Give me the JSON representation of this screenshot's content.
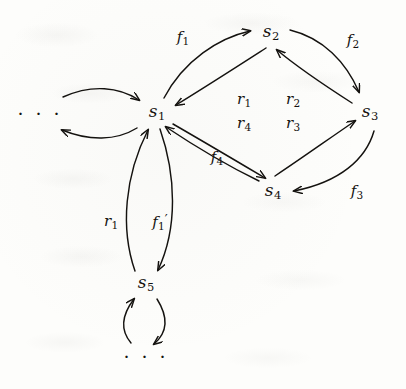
{
  "figure": {
    "kind": "state-transition-diagram",
    "background_color": "#fdfdfb",
    "ink_color": "#14120f",
    "width": 406,
    "height": 389
  },
  "nodes": [
    {
      "id": "dots_left",
      "label": "· · ·",
      "base": "",
      "sub": "",
      "x": 40,
      "y": 113,
      "type": "ellipsis"
    },
    {
      "id": "s1",
      "label": "s1",
      "base": "s",
      "sub": "1",
      "x": 157,
      "y": 113,
      "type": "state"
    },
    {
      "id": "s2",
      "label": "s2",
      "base": "s",
      "sub": "2",
      "x": 271,
      "y": 33,
      "type": "state"
    },
    {
      "id": "s3",
      "label": "s3",
      "base": "s",
      "sub": "3",
      "x": 370,
      "y": 113,
      "type": "state"
    },
    {
      "id": "s4",
      "label": "s4",
      "base": "s",
      "sub": "4",
      "x": 273,
      "y": 192,
      "type": "state"
    },
    {
      "id": "s5",
      "label": "s5",
      "base": "s",
      "sub": "5",
      "x": 146,
      "y": 284,
      "type": "state"
    },
    {
      "id": "dots_bottom",
      "label": "· · ·",
      "base": "",
      "sub": "",
      "x": 146,
      "y": 356,
      "type": "ellipsis"
    }
  ],
  "edge_labels": [
    {
      "id": "f1",
      "base": "f",
      "sub": "1",
      "prime": "",
      "x": 183,
      "y": 38,
      "from": "s1",
      "to": "s2"
    },
    {
      "id": "f2",
      "base": "f",
      "sub": "2",
      "prime": "",
      "x": 353,
      "y": 41,
      "from": "s2",
      "to": "s3"
    },
    {
      "id": "f3",
      "base": "f",
      "sub": "3",
      "prime": "",
      "x": 357,
      "y": 192,
      "from": "s3",
      "to": "s4"
    },
    {
      "id": "f4",
      "base": "f",
      "sub": "4",
      "prime": "",
      "x": 217,
      "y": 158,
      "from": "s4",
      "to": "s1"
    },
    {
      "id": "r1_center",
      "base": "r",
      "sub": "1",
      "prime": "",
      "x": 244,
      "y": 100,
      "from": "s2",
      "to": "s1"
    },
    {
      "id": "r2_center",
      "base": "r",
      "sub": "2",
      "prime": "",
      "x": 293,
      "y": 100,
      "from": "s3",
      "to": "s2"
    },
    {
      "id": "r4_center",
      "base": "r",
      "sub": "4",
      "prime": "",
      "x": 244,
      "y": 124,
      "from": "s1",
      "to": "s4"
    },
    {
      "id": "r3_center",
      "base": "r",
      "sub": "3",
      "prime": "",
      "x": 293,
      "y": 124,
      "from": "s4",
      "to": "s3"
    },
    {
      "id": "r1_lower",
      "base": "r",
      "sub": "1",
      "prime": "",
      "x": 111,
      "y": 222,
      "from": "s5",
      "to": "s1"
    },
    {
      "id": "f1_prime",
      "base": "f",
      "sub": "1",
      "prime": "′",
      "x": 160,
      "y": 222,
      "from": "s1",
      "to": "s5"
    }
  ],
  "edges": [
    {
      "id": "e_dots_to_s1",
      "from": "dots_left",
      "to": "s1",
      "label": ""
    },
    {
      "id": "e_s1_to_dots",
      "from": "s1",
      "to": "dots_left",
      "label": ""
    },
    {
      "id": "e_s1_s2",
      "from": "s1",
      "to": "s2",
      "label": "f1"
    },
    {
      "id": "e_s2_s1",
      "from": "s2",
      "to": "s1",
      "label": "r1"
    },
    {
      "id": "e_s2_s3",
      "from": "s2",
      "to": "s3",
      "label": "f2"
    },
    {
      "id": "e_s3_s2",
      "from": "s3",
      "to": "s2",
      "label": "r2"
    },
    {
      "id": "e_s3_s4",
      "from": "s3",
      "to": "s4",
      "label": "f3"
    },
    {
      "id": "e_s4_s3",
      "from": "s4",
      "to": "s3",
      "label": "r3"
    },
    {
      "id": "e_s4_s1",
      "from": "s4",
      "to": "s1",
      "label": "f4"
    },
    {
      "id": "e_s1_s4",
      "from": "s1",
      "to": "s4",
      "label": "r4"
    },
    {
      "id": "e_s1_s5",
      "from": "s1",
      "to": "s5",
      "label": "f1′"
    },
    {
      "id": "e_s5_s1",
      "from": "s5",
      "to": "s1",
      "label": "r1"
    },
    {
      "id": "e_s5_dots",
      "from": "s5",
      "to": "dots_bottom",
      "label": ""
    },
    {
      "id": "e_dots_s5",
      "from": "dots_bottom",
      "to": "s5",
      "label": ""
    }
  ]
}
